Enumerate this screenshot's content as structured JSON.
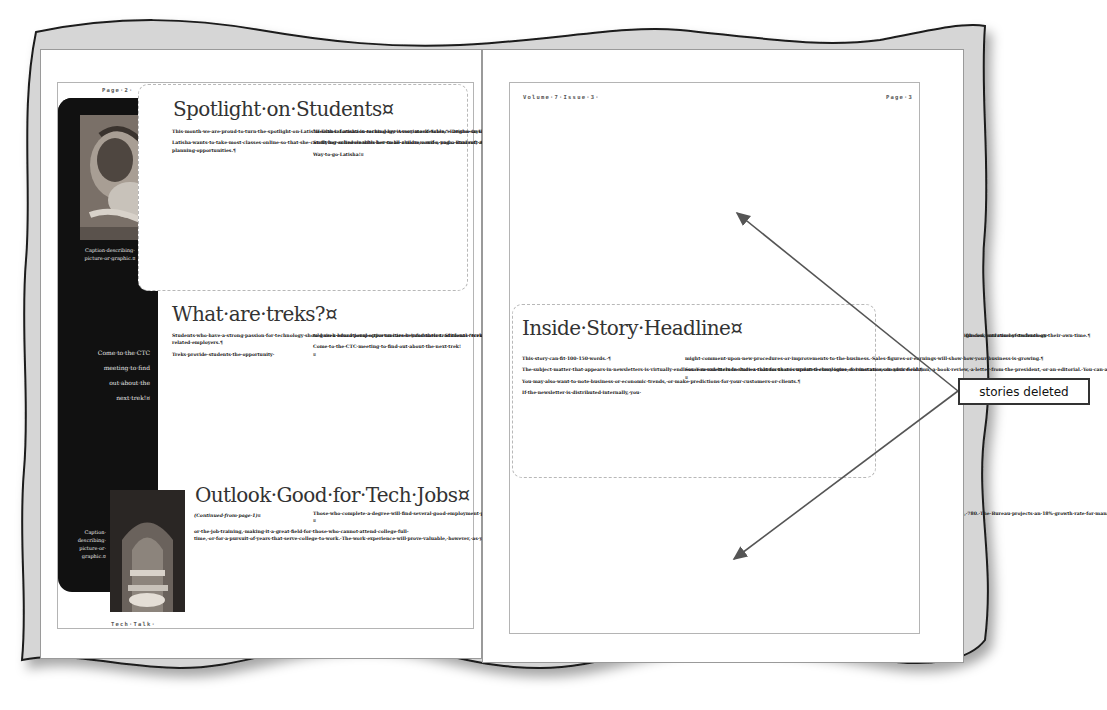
{
  "left_page": {
    "header": "Page·2·",
    "footer": "Tech·Talk·",
    "sidebar": {
      "top_caption": "Caption·describing· picture·or·graphic.¤",
      "pull_quote": [
        "Come·to·the·CTC",
        "meeting·to·find",
        "out·about·the",
        "next·trek!¤"
      ],
      "bottom_caption": [
        "Caption·",
        "describing·",
        "picture·or·",
        "graphic.¤"
      ]
    },
    "stories": [
      {
        "headline": "Spotlight·on·Students¤",
        "col1": [
          "This·month·we·are·proud·to·turn·the·spotlight·on·Latisha·Evans.·Latisha·is·earning·her·Associate·of·Science·Degree·in·Health·Information·Technology·and·is·an·active·member·of·the·Campus·Technology·Club.¶",
          "Latisha·wants·to·take·most·classes·online·so·that·she·can·fit·her·schedule·with·her·small·children·and·a·yoga.·Bancroft·Area·Community·College·was·a·perfect·fit.·Also,·she·knew·joining·CTC·would·look·good·on·her·resume·as·well·as·provide·career-planning·opportunities.¶"
        ],
        "col2": [
          "\"Health·information·technology·is·very·marketable,\"·Latisha·says.·\"And,·I·can·use·technology·while·helping·people.·That's·my·goal.\"¶",
          "Studying·online·enables·her·to·be·a·mom,·a·wife,·and·a·student,·allowing·her·to·earn·her·Health·Information·Technology·degree·in·a·short·amount·of·time.¶",
          "Way·to·go·Latisha!¤"
        ]
      },
      {
        "headline": "What·are·treks?¤",
        "col1": [
          "Students·who·have·a·strong·passion·for·technology·should·seek·educational·opportunities·beyond·their·traditional·recruiting·avenues.·To·this·end,·the·Campus·Technology·Club·partners·with·the·School·of·Technology·Career·Center·and·the·Alumni·Office·to·organize·networking·\"treks\"·to·areas·that·have·a·high·concentration·of·technology-related·employers.¶",
          "Treks·provide·students·the·opportunity·"
        ],
        "col2": [
          "to·gain·a·broad·perspective·on·career·information.·Students·\"trek\"·to·learn·about·companies,·meet·with·local·alumni·to·understand·their·career·paths,·and·converse·with·corporate·recruiters·to·understand·technology·opportunities.·Treks·are·organized,·funded,·and·run·by·students·on·their·own·time.¶",
          "Come·to·the·CTC·meeting·to·find·out·about·the·next·trek!¤"
        ]
      },
      {
        "headline": "Outlook·Good·for·Tech·Jobs¤",
        "continued": "(Continued·from·page·1)¤",
        "col1": [
          "or·the·job·training,·making·it·a·great·field·for·those·who·cannot·attend·college·full-time,·or·for·a·pursuit·of·years·that·serve·college·to·work.·The·work·experience·will·prove·valuable,·however,·as·you·complete·a·degree·and·reach·high·levels·of·employment.¶"
        ],
        "col2": [
          "Those·who·complete·a·degree·will·find·several·good·employment·prospects.·A·program·manager·can·expect·a·starting·salary·of·$70,·380·a·year.·At·the·high·end,·a·system·manager·with·five·years·of·experience·commands·an·average·annual·salary·of·$115,·780.·The·Bureau·projects·an·18%·growth·rate·for·manager·positions.·This·becomes·a·desirable·goal·for·technologists·with·degrees.¤"
        ]
      }
    ]
  },
  "right_page": {
    "header_left": "Volume·7·Issue·3·",
    "header_right": "Page·3",
    "story": {
      "headline": "Inside·Story·Headline¤",
      "col1": [
        "This·story·can·fit·100-150·words.·¶",
        "The·subject·matter·that·appears·in·newsletters·is·virtually·endless.·You·can·include·stories·that·focus·on·current·technologies·or·innovations·in·your·field.¶",
        "You·may·also·want·to·note·business·or·economic·trends,·or·make·predictions·for·your·customers·or·clients.¶",
        "If·the·newsletter·is·distributed·internally,·you·"
      ],
      "col2": [
        "might·comment·upon·new·procedures·or·improvements·to·the·business.·Sales·figures·or·earnings·will·show·how·your·business·is·growing.¶",
        "Some·newsletters·include·a·column·that·is·updated·every·issue,·for·instance,·an·advice·column,·a·book·review,·a·letter·from·the·president,·or·an·editorial.·You·can·also·profile·new·employees·or·top·customers·or·vendors.¤"
      ]
    }
  },
  "annotation": {
    "callout_label": "stories deleted",
    "arrow_color": "#555555",
    "callout_border_color": "#333333"
  },
  "colors": {
    "backdrop_gray": "#d6d6d6",
    "sidebar_dark": "#111111",
    "dashed_border": "#b8b8b8",
    "headline_text": "#333333"
  }
}
